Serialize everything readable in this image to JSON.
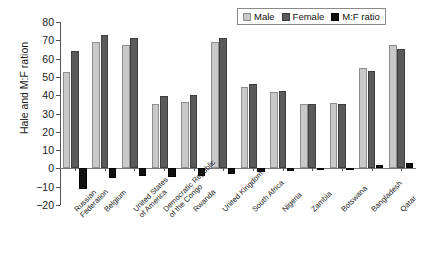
{
  "chart_data": {
    "type": "bar",
    "title": "",
    "xlabel": "",
    "ylabel": "Hale and M:F ration",
    "ylim": [
      -20,
      80
    ],
    "yticks": [
      -20,
      -10,
      0,
      10,
      20,
      30,
      40,
      50,
      60,
      70,
      80
    ],
    "ytick_labels": [
      "−20",
      "−10",
      "0",
      "10",
      "20",
      "30",
      "40",
      "50",
      "60",
      "70",
      "80"
    ],
    "grid": false,
    "legend_position": "top-right",
    "categories": [
      "Russian\nFederation",
      "Belgium",
      "United States\nof America",
      "Democratic Republic\nof the Congo",
      "Rwanda",
      "United Kingdom",
      "South Africa",
      "Nigeria",
      "Zambia",
      "Botswana",
      "Bangladesh",
      "Qatar"
    ],
    "series": [
      {
        "name": "Male",
        "color": "#c9c9c9",
        "values": [
          52.5,
          69.0,
          67.5,
          35.0,
          36.5,
          69.0,
          44.5,
          41.5,
          35.0,
          35.5,
          55.0,
          67.5
        ]
      },
      {
        "name": "Female",
        "color": "#5a5a5a",
        "values": [
          64.0,
          73.0,
          71.0,
          39.5,
          40.0,
          71.5,
          46.0,
          42.5,
          35.0,
          35.0,
          53.0,
          65.0
        ]
      },
      {
        "name": "M:F ratio",
        "color": "#111111",
        "values": [
          -11.5,
          -5.0,
          -4.0,
          -4.5,
          -4.0,
          -3.0,
          -2.0,
          -1.5,
          -0.5,
          -0.5,
          1.8,
          2.8
        ]
      }
    ]
  },
  "legend": {
    "items": [
      {
        "label": "Male"
      },
      {
        "label": "Female"
      },
      {
        "label": "M:F ratio"
      }
    ]
  }
}
